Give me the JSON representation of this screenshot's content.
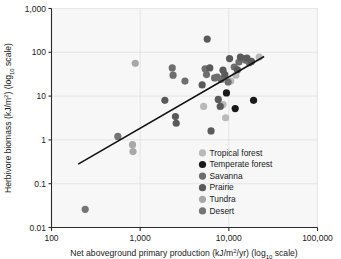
{
  "chart_data": {
    "type": "scatter",
    "title": "",
    "xlabel": "Net aboveground primary production (kJ/m2/yr) (log10 scale)",
    "ylabel": "Herbivore biomass (kJ/m2) (log10 scale)",
    "xscale": "log",
    "yscale": "log",
    "xlim": [
      100,
      100000
    ],
    "ylim": [
      0.01,
      1000
    ],
    "xticks": [
      100,
      1000,
      10000,
      100000
    ],
    "xtick_labels": [
      "100",
      "1,000",
      "10,000",
      "100,000"
    ],
    "yticks": [
      0.01,
      0.1,
      1,
      10,
      100,
      1000
    ],
    "ytick_labels": [
      "0.01",
      "0.1",
      "1",
      "10",
      "100",
      "1,000"
    ],
    "grid": true,
    "legend_position": "inside-lower-right",
    "trendline": {
      "x": [
        200,
        25000
      ],
      "y": [
        0.28,
        80
      ],
      "color": "#111111"
    },
    "series": [
      {
        "name": "Tropical forest",
        "color": "#b9b9b9",
        "points": [
          [
            5200,
            5.8
          ],
          [
            8600,
            6.4
          ],
          [
            9200,
            3.2
          ],
          [
            10500,
            22.0
          ],
          [
            12000,
            30.0
          ],
          [
            22000,
            78.0
          ]
        ]
      },
      {
        "name": "Temperate forest",
        "color": "#1a1a1a",
        "points": [
          [
            9400,
            11.8
          ],
          [
            11800,
            5.2
          ],
          [
            19000,
            8.0
          ]
        ]
      },
      {
        "name": "Savanna",
        "color": "#6e6e6e",
        "points": [
          [
            2300,
            44.0
          ],
          [
            2350,
            30.0
          ],
          [
            3200,
            22.0
          ],
          [
            5400,
            42.0
          ],
          [
            5600,
            31.0
          ],
          [
            6900,
            26.0
          ],
          [
            7400,
            27.0
          ],
          [
            8200,
            24.0
          ],
          [
            9800,
            21.0
          ],
          [
            11500,
            46.0
          ],
          [
            13000,
            60.0
          ],
          [
            14500,
            72.0
          ],
          [
            15500,
            66.0
          ],
          [
            17000,
            58.0
          ]
        ]
      },
      {
        "name": "Prairie",
        "color": "#5a5a5a",
        "points": [
          [
            1900,
            8.0
          ],
          [
            2500,
            3.4
          ],
          [
            2550,
            2.4
          ],
          [
            5000,
            18.0
          ],
          [
            5700,
            200.0
          ],
          [
            6100,
            44.0
          ],
          [
            6300,
            1.6
          ],
          [
            7600,
            8.4
          ],
          [
            8000,
            5.8
          ],
          [
            8600,
            39.0
          ],
          [
            9000,
            31.0
          ],
          [
            10200,
            72.0
          ],
          [
            12500,
            40.0
          ],
          [
            13500,
            78.0
          ],
          [
            16000,
            74.0
          ],
          [
            18000,
            62.0
          ]
        ]
      },
      {
        "name": "Tundra",
        "color": "#a8a8a8",
        "points": [
          [
            820,
            0.78
          ],
          [
            830,
            0.54
          ],
          [
            880,
            56.0
          ]
        ]
      },
      {
        "name": "Desert",
        "color": "#757575",
        "points": [
          [
            240,
            0.026
          ],
          [
            560,
            1.2
          ]
        ]
      }
    ],
    "legend_entries": [
      {
        "label": "Tropical forest",
        "color": "#b9b9b9"
      },
      {
        "label": "Temperate forest",
        "color": "#1a1a1a"
      },
      {
        "label": "Savanna",
        "color": "#6e6e6e"
      },
      {
        "label": "Prairie",
        "color": "#5a5a5a"
      },
      {
        "label": "Tundra",
        "color": "#a8a8a8"
      },
      {
        "label": "Desert",
        "color": "#757575"
      }
    ]
  },
  "axis": {
    "x_title_parts": {
      "main": "Net aboveground primary production (kJ/m",
      "sup": "2",
      "mid": "/yr) (log",
      "sub": "10",
      "tail": " scale)"
    },
    "y_title_parts": {
      "main": "Herbivore biomass (kJ/m",
      "sup": "2",
      "mid": ") (log",
      "sub": "10",
      "tail": " scale)"
    }
  },
  "style": {
    "plot_background": "#f7f7f7",
    "page_background": "#ffffff",
    "axis_color": "#2a2a2a",
    "grid_color": "#dcdcdc"
  }
}
